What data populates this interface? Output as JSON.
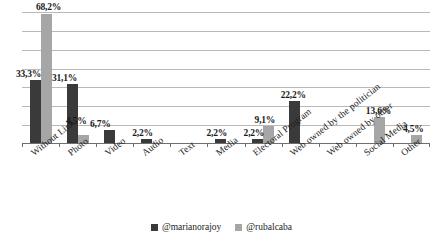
{
  "chart_data": {
    "type": "bar",
    "title": "",
    "subtitle": "",
    "xlabel": "",
    "ylabel": "",
    "ylim": [
      0,
      70
    ],
    "grid": true,
    "gridlines": [
      0,
      10,
      20,
      30,
      40,
      50,
      60,
      70
    ],
    "axis_tick_labels_visible": false,
    "legend_position": "bottom-center",
    "categories": [
      "Without Link",
      "Photo",
      "Video",
      "Audio",
      "Text",
      "Media",
      "Electoral Program",
      "Web owned by the politician",
      "Web owned by other",
      "Social Media",
      "Other"
    ],
    "series": [
      {
        "name": "@marianorajoy",
        "color": "#3a3a3a",
        "values": [
          33.3,
          31.1,
          6.7,
          2.2,
          null,
          2.2,
          2.2,
          22.2,
          null,
          null,
          null
        ],
        "labels": [
          "33,3%",
          "31,1%",
          "6,7%",
          "2,2%",
          "",
          "2,2%",
          "2,2%",
          "22,2%",
          "",
          "",
          ""
        ]
      },
      {
        "name": "@rubalcaba",
        "color": "#a6a6a6",
        "values": [
          68.2,
          4.5,
          null,
          null,
          null,
          null,
          9.1,
          null,
          null,
          13.6,
          4.5
        ],
        "labels": [
          "68,2%",
          "4,5%",
          "",
          "",
          "",
          "",
          "9,1%",
          "",
          "",
          "13,6%",
          "4,5%"
        ]
      }
    ]
  },
  "legend": {
    "items": [
      {
        "label": "@marianorajoy",
        "color": "#3a3a3a",
        "marker": "square-marker"
      },
      {
        "label": "@rubalcaba",
        "color": "#a6a6a6",
        "marker": "square-marker"
      }
    ]
  }
}
